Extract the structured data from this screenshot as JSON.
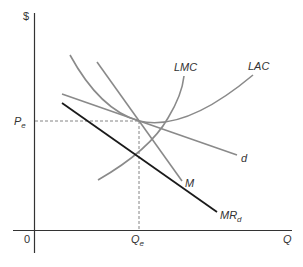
{
  "diagram": {
    "axes": {
      "y_label": "$",
      "x_label": "Q",
      "origin_label": "0"
    },
    "equilibrium": {
      "price_label": "P",
      "price_sub": "e",
      "quantity_label": "Q",
      "quantity_sub": "e"
    },
    "curves": {
      "lmc": {
        "label": "LMC"
      },
      "lac": {
        "label": "LAC"
      },
      "d": {
        "label": "d"
      },
      "m": {
        "label": "M"
      },
      "mrd": {
        "label": "MR",
        "sub": "d"
      }
    },
    "colors": {
      "axis": "#333333",
      "curve_gray": "#8a8a8a",
      "mr_curve": "#1a1a1a",
      "dashed": "#777777"
    }
  }
}
